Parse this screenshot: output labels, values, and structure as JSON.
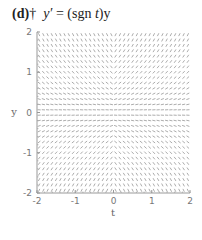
{
  "figure": {
    "panel": "(d)",
    "dagger": "†",
    "equation_lhs": "y′",
    "equation_eq": " = ",
    "equation_rhs_pre": "(sgn ",
    "equation_rhs_var": "t",
    "equation_rhs_post": ")y"
  },
  "chart_data": {
    "type": "slope_field",
    "equation": "y' = sgn(t) * y",
    "xlabel": "t",
    "ylabel": "y",
    "xlim": [
      -2,
      2
    ],
    "ylim": [
      -2,
      2
    ],
    "xticks": [
      -2,
      -1,
      0,
      1,
      2
    ],
    "yticks": [
      -2,
      -1,
      0,
      1,
      2
    ],
    "xtick_labels": [
      "-2",
      "-1",
      "0",
      "1",
      "2"
    ],
    "ytick_labels": [
      "-2",
      "-1",
      "0",
      "1",
      "2"
    ],
    "grid": false,
    "grid_columns": 36,
    "grid_rows": 30,
    "segment_color": "#888888",
    "axis_color": "#999999"
  }
}
